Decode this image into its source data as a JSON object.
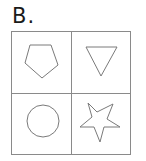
{
  "label": "B.",
  "grid": {
    "rows": 2,
    "cols": 2,
    "line_color": "#8a8a8a",
    "shape_color": "#7a7a7a",
    "cells": [
      {
        "position": "top-left",
        "shape": "pentagon"
      },
      {
        "position": "top-right",
        "shape": "inverted-triangle"
      },
      {
        "position": "bottom-left",
        "shape": "circle"
      },
      {
        "position": "bottom-right",
        "shape": "star"
      }
    ]
  }
}
